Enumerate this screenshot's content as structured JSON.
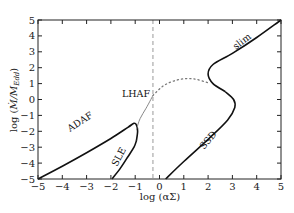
{
  "chart_data": {
    "type": "line",
    "title": "",
    "xlabel": "log (αΣ)",
    "ylabel": "log (M/M_Edd)",
    "ylabel_main": "log (",
    "ylabel_sub": "Edd",
    "xlim": [
      -5,
      5
    ],
    "ylim": [
      -5,
      5
    ],
    "xticks": [
      -5,
      -4,
      -3,
      -2,
      -1,
      0,
      1,
      2,
      3,
      4,
      5
    ],
    "yticks": [
      -5,
      -4,
      -3,
      -2,
      -1,
      0,
      1,
      2,
      3,
      4,
      5
    ],
    "xtick_labels": [
      "−5",
      "−4",
      "−3",
      "−2",
      "−1",
      "0",
      "1",
      "2",
      "3",
      "4",
      "5"
    ],
    "ytick_labels": [
      "−5",
      "−4",
      "−3",
      "−2",
      "−1",
      "0",
      "1",
      "2",
      "3",
      "4",
      "5"
    ],
    "grid": false,
    "legend": "none (inline curve labels)",
    "vertical_reference_line": {
      "x": -0.27,
      "style": "dashed",
      "color": "#999999"
    },
    "series": [
      {
        "name": "ADAF",
        "style": "solid",
        "color": "#111111",
        "x": [
          -5.0,
          -4.0,
          -3.0,
          -2.0,
          -1.3,
          -1.05,
          -0.95,
          -0.9,
          -0.95
        ],
        "y": [
          -5.0,
          -4.2,
          -3.35,
          -2.45,
          -1.75,
          -1.5,
          -1.6,
          -2.0,
          -2.6
        ]
      },
      {
        "name": "SLE",
        "style": "solid",
        "color": "#111111",
        "x": [
          -1.95,
          -1.6,
          -1.3,
          -1.05,
          -0.95
        ],
        "y": [
          -5.0,
          -4.3,
          -3.6,
          -3.0,
          -2.6
        ]
      },
      {
        "name": "LHAF connector",
        "style": "solid",
        "color": "#888888",
        "x": [
          -0.95,
          -0.8,
          -0.55,
          -0.27
        ],
        "y": [
          -1.9,
          -1.2,
          -0.55,
          0.25
        ]
      },
      {
        "name": "unstable branch",
        "style": "dotted",
        "color": "#777777",
        "x": [
          -0.27,
          0.2,
          0.8,
          1.4,
          2.0
        ],
        "y": [
          0.25,
          0.9,
          1.25,
          1.3,
          1.05
        ]
      },
      {
        "name": "SSD",
        "style": "solid",
        "color": "#111111",
        "x": [
          0.25,
          1.0,
          2.0,
          2.8,
          3.1,
          3.05,
          2.7
        ],
        "y": [
          -5.0,
          -3.9,
          -2.5,
          -1.3,
          -0.5,
          0.0,
          0.5
        ]
      },
      {
        "name": "slim",
        "style": "solid",
        "color": "#111111",
        "x": [
          2.7,
          2.2,
          2.0,
          2.2,
          3.0,
          4.0,
          5.0
        ],
        "y": [
          0.5,
          1.0,
          1.6,
          2.2,
          2.9,
          3.9,
          5.0
        ]
      }
    ],
    "annotations": [
      {
        "text": "ADAF",
        "x": -3.3,
        "y": -2.7,
        "rotation": -35
      },
      {
        "text": "SLE",
        "x": -1.6,
        "y": -3.8,
        "rotation": -60
      },
      {
        "text": "LHAF",
        "x": -1.0,
        "y": 0.1,
        "rotation": 0
      },
      {
        "text": "SSD",
        "x": 1.6,
        "y": -2.6,
        "rotation": -50
      },
      {
        "text": "slim",
        "x": 3.2,
        "y": 2.9,
        "rotation": -38
      }
    ]
  },
  "labels": {
    "adaf": "ADAF",
    "sle": "SLE",
    "lhaf": "LHAF",
    "ssd": "SSD",
    "slim": "slim",
    "xlabel": "log (αΣ)",
    "ylabel_prefix": "log (",
    "ylabel_m": "Ṁ/M",
    "ylabel_sub": "Edd",
    "ylabel_suffix": ")"
  }
}
